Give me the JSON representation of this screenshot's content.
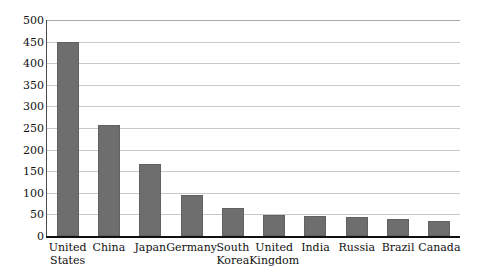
{
  "caption": {
    "text": "Figure — clipped caption",
    "visible_fragment": ""
  },
  "chart_data": {
    "type": "bar",
    "title": "",
    "xlabel": "",
    "ylabel": "",
    "ylim": [
      0,
      500
    ],
    "ytick_step": 50,
    "grid": true,
    "legend": false,
    "orientation": "vertical",
    "bar_color": "#6e6e6e",
    "categories": [
      "United States",
      "China",
      "Japan",
      "Germany",
      "South Korea",
      "United Kingdom",
      "India",
      "Russia",
      "Brazil",
      "Canada"
    ],
    "category_lines": [
      [
        "United",
        "States"
      ],
      [
        "China",
        ""
      ],
      [
        "Japan",
        ""
      ],
      [
        "Germany",
        ""
      ],
      [
        "South",
        "Korea"
      ],
      [
        "United",
        "Kingdom"
      ],
      [
        "India",
        ""
      ],
      [
        "Russia",
        ""
      ],
      [
        "Brazil",
        ""
      ],
      [
        "Canada",
        ""
      ]
    ],
    "values": [
      450,
      257,
      167,
      96,
      65,
      48,
      47,
      45,
      40,
      35
    ],
    "ytick_labels": [
      "500",
      "450",
      "400",
      "350",
      "300",
      "250",
      "200",
      "150",
      "100",
      "50",
      "0"
    ],
    "ytick_values": [
      500,
      450,
      400,
      350,
      300,
      250,
      200,
      150,
      100,
      50,
      0
    ]
  }
}
